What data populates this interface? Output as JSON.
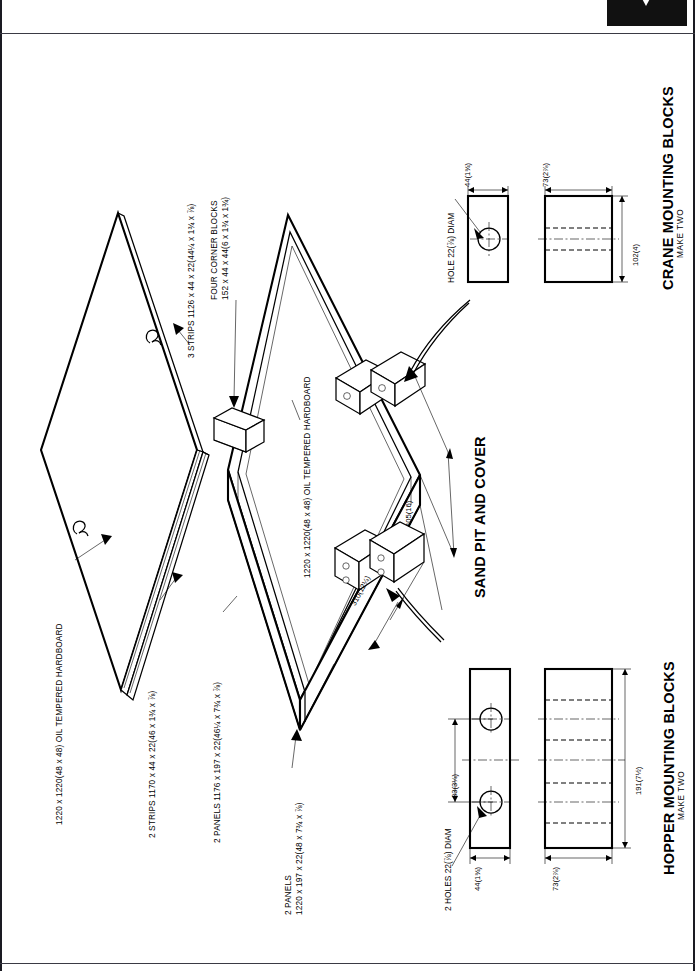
{
  "sheet": {
    "orientation": "landscape-rotated",
    "background": "#ffffff",
    "line_color": "#000000"
  },
  "drawing": {
    "main_title": "SAND PIT AND COVER",
    "detail_titles": [
      {
        "title": "CRANE MOUNTING BLOCKS",
        "subtitle": "MAKE TWO"
      },
      {
        "title": "HOPPER MOUNTING BLOCKS",
        "subtitle": "MAKE TWO"
      }
    ]
  },
  "part_notes": [
    {
      "id": "cover-panel",
      "text": "1220 x 1220(48 x 48) OIL TEMPERED HARDBOARD"
    },
    {
      "id": "cover-strips-2",
      "text": "2 STRIPS 1170 x 44 x 22(46 x 1¾ x ⅞)"
    },
    {
      "id": "cover-strips-3",
      "text": "3 STRIPS 1126 x 44 x 22(44¼ x 1¾ x ⅞)"
    },
    {
      "id": "corner-blocks",
      "line1": "FOUR CORNER BLOCKS",
      "line2": "152 x 44 x 44(6 x 1¾ x 1¾)"
    },
    {
      "id": "side-panels-1176",
      "text": "2 PANELS 1176 x 197 x 22(46¼ x 7¾ x ⅞)"
    },
    {
      "id": "base-panel",
      "text": "1220 x 1220(48 x 48) OIL TEMPERED HARDBOARD"
    },
    {
      "id": "side-panels-1220",
      "line1": "2 PANELS",
      "line2": "1220 x 197 x 22(48 x 7¾ x ⅞)"
    }
  ],
  "main_dimensions": [
    {
      "id": "dim-405",
      "text": "405(16)"
    },
    {
      "id": "dim-310",
      "text": "310(12¼)"
    }
  ],
  "crane_block": {
    "hole_note": "HOLE 22(⅞) DIAM",
    "width": "44(1¾)",
    "depth": "73(2⅞)",
    "length": "102(4)"
  },
  "hopper_block": {
    "hole_note": "2 HOLES 22(⅞) DIAM",
    "hole_spacing": "83(3¼)",
    "width": "44(1¾)",
    "depth": "73(2⅞)",
    "length": "191(7½)"
  }
}
